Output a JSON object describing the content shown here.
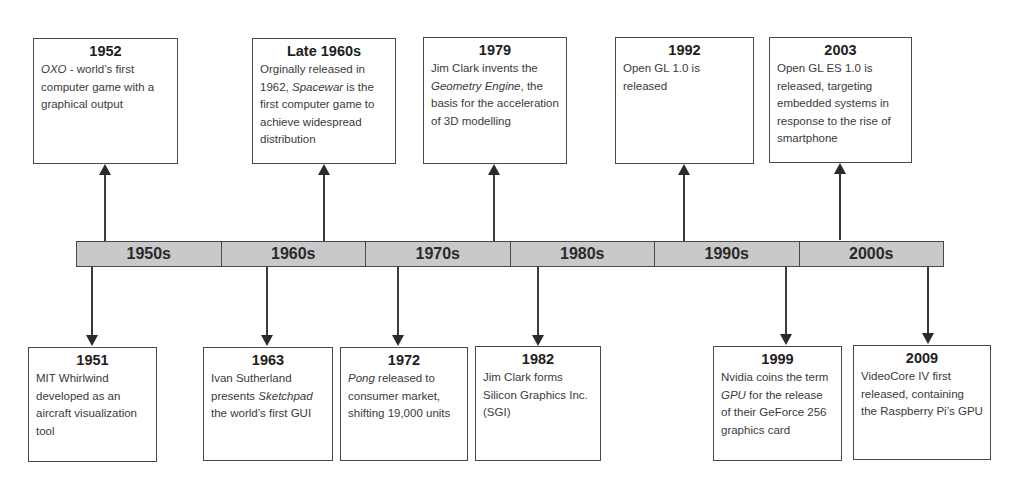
{
  "timeline": {
    "decades": [
      "1950s",
      "1960s",
      "1970s",
      "1980s",
      "1990s",
      "2000s"
    ],
    "bar_fill_color": "#c9c9c9",
    "border_color": "#4a4a4a"
  },
  "events_above": [
    {
      "year": "1952",
      "desc_parts": [
        {
          "text": "OXO",
          "italic": true
        },
        {
          "text": " - world’s first computer game with a graphical output",
          "italic": false
        }
      ],
      "decade": "1950s"
    },
    {
      "year": "Late 1960s",
      "desc_parts": [
        {
          "text": "Orginally released in 1962, ",
          "italic": false
        },
        {
          "text": "Spacewar",
          "italic": true
        },
        {
          "text": " is the first computer game to achieve widespread distribution",
          "italic": false
        }
      ],
      "decade": "1960s"
    },
    {
      "year": "1979",
      "desc_parts": [
        {
          "text": "Jim Clark invents the ",
          "italic": false
        },
        {
          "text": "Geometry Engine",
          "italic": true
        },
        {
          "text": ", the basis for the acceleration of 3D modelling",
          "italic": false
        }
      ],
      "decade": "1970s"
    },
    {
      "year": "1992",
      "desc_parts": [
        {
          "text": "Open GL 1.0 is released",
          "italic": false
        }
      ],
      "decade": "1990s"
    },
    {
      "year": "2003",
      "desc_parts": [
        {
          "text": "Open GL ES 1.0 is released, targeting embedded systems in response to the rise of smartphone",
          "italic": false
        }
      ],
      "decade": "2000s"
    }
  ],
  "events_below": [
    {
      "year": "1951",
      "desc_parts": [
        {
          "text": "MIT Whirlwind developed as an aircraft visualization tool",
          "italic": false
        }
      ],
      "decade": "1950s"
    },
    {
      "year": "1963",
      "desc_parts": [
        {
          "text": "Ivan Sutherland presents ",
          "italic": false
        },
        {
          "text": "Sketchpad",
          "italic": true
        },
        {
          "text": " the world’s first GUI",
          "italic": false
        }
      ],
      "decade": "1960s"
    },
    {
      "year": "1972",
      "desc_parts": [
        {
          "text": "Pong",
          "italic": true
        },
        {
          "text": " released to consumer market, shifting 19,000 units",
          "italic": false
        }
      ],
      "decade": "1970s"
    },
    {
      "year": "1982",
      "desc_parts": [
        {
          "text": "Jim Clark forms Silicon Graphics Inc. (SGI)",
          "italic": false
        }
      ],
      "decade": "1980s"
    },
    {
      "year": "1999",
      "desc_parts": [
        {
          "text": "Nvidia coins the term ",
          "italic": false
        },
        {
          "text": "GPU",
          "italic": true
        },
        {
          "text": " for the release of their GeForce 256 graphics card",
          "italic": false
        }
      ],
      "decade": "1990s"
    },
    {
      "year": "2009",
      "desc_parts": [
        {
          "text": "VideoCore IV first released, containing the Raspberry Pi’s GPU",
          "italic": false
        }
      ],
      "decade": "2000s"
    }
  ]
}
